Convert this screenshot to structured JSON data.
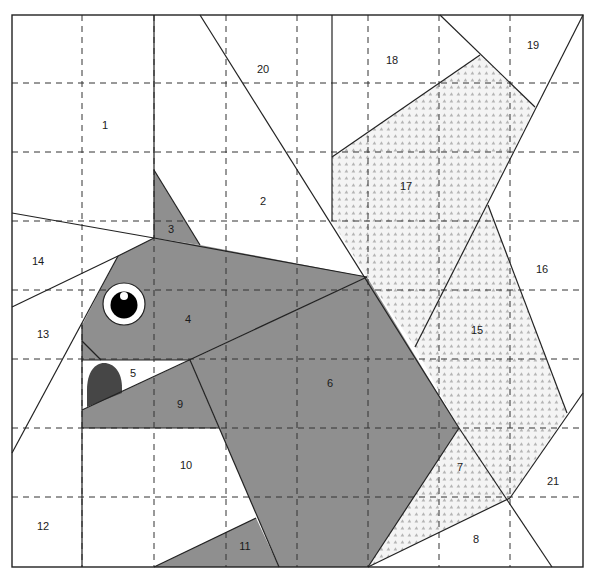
{
  "diagram": {
    "colors": {
      "fill_gray": "#8f8f8f",
      "pattern_bg": "#f3f3f3",
      "pattern_dot": "#b8b8b8",
      "tongue": "#464646",
      "line": "#222222",
      "grid": "#333333"
    },
    "regions": [
      {
        "id": "1",
        "label": "1",
        "fill": "white",
        "x": 105,
        "y": 126
      },
      {
        "id": "2",
        "label": "2",
        "fill": "white",
        "x": 263,
        "y": 202
      },
      {
        "id": "3",
        "label": "3",
        "fill": "gray",
        "x": 171,
        "y": 230
      },
      {
        "id": "4",
        "label": "4",
        "fill": "gray",
        "x": 188,
        "y": 320
      },
      {
        "id": "5",
        "label": "5",
        "fill": "white",
        "x": 133,
        "y": 374
      },
      {
        "id": "6",
        "label": "6",
        "fill": "gray",
        "x": 330,
        "y": 384
      },
      {
        "id": "7",
        "label": "7",
        "fill": "pattern",
        "x": 460,
        "y": 468
      },
      {
        "id": "8",
        "label": "8",
        "fill": "white",
        "x": 476,
        "y": 540
      },
      {
        "id": "9",
        "label": "9",
        "fill": "gray",
        "x": 180,
        "y": 405
      },
      {
        "id": "10",
        "label": "10",
        "fill": "white",
        "x": 186,
        "y": 466
      },
      {
        "id": "11",
        "label": "11",
        "fill": "gray",
        "x": 245,
        "y": 547
      },
      {
        "id": "12",
        "label": "12",
        "fill": "white",
        "x": 43,
        "y": 527
      },
      {
        "id": "13",
        "label": "13",
        "fill": "white",
        "x": 43,
        "y": 335
      },
      {
        "id": "14",
        "label": "14",
        "fill": "white",
        "x": 38,
        "y": 262
      },
      {
        "id": "15",
        "label": "15",
        "fill": "pattern",
        "x": 477,
        "y": 331
      },
      {
        "id": "16",
        "label": "16",
        "fill": "white",
        "x": 542,
        "y": 270
      },
      {
        "id": "17",
        "label": "17",
        "fill": "pattern",
        "x": 406,
        "y": 187
      },
      {
        "id": "18",
        "label": "18",
        "fill": "white",
        "x": 392,
        "y": 61
      },
      {
        "id": "19",
        "label": "19",
        "fill": "white",
        "x": 533,
        "y": 46
      },
      {
        "id": "20",
        "label": "20",
        "fill": "white",
        "x": 263,
        "y": 70
      },
      {
        "id": "21",
        "label": "21",
        "fill": "white",
        "x": 553,
        "y": 482
      }
    ],
    "grid": {
      "x_lines": [
        82,
        154,
        226,
        297,
        368,
        439,
        510
      ],
      "y_lines": [
        83,
        152,
        221,
        290,
        359,
        428,
        497
      ],
      "bounds": {
        "left": 12,
        "top": 15,
        "right": 583,
        "bottom": 567
      }
    },
    "eye": {
      "cx": 124,
      "cy": 304,
      "outer_r": 21,
      "pupil_r": 14,
      "highlight_cx": 124,
      "highlight_cy": 296,
      "highlight_r": 4
    }
  }
}
